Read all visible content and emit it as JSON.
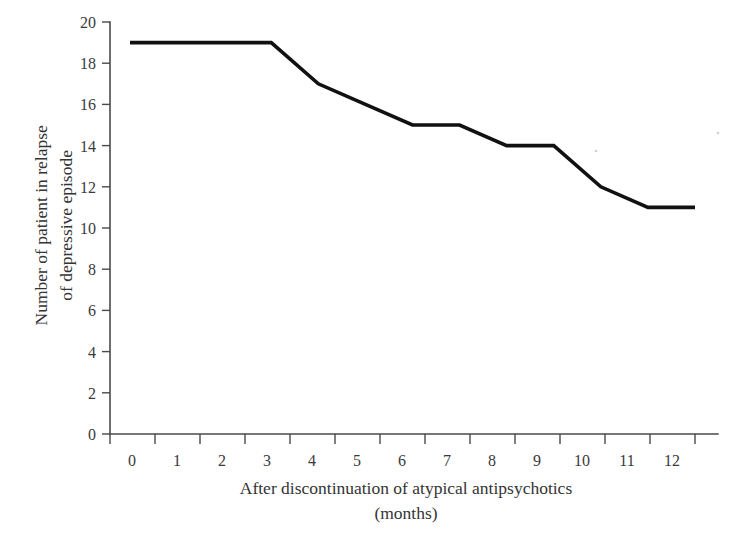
{
  "chart_data": {
    "type": "line",
    "title": "",
    "subtitle": "",
    "xlabel": "After discontinuation of atypical antipsychotics",
    "xlabel_unit": "(months)",
    "ylabel": "Number of patient in relapse\nof depressive episode",
    "ylabel_line1": "Number of patient in relapse",
    "ylabel_line2": "of depressive episode",
    "x": [
      0,
      1,
      2,
      3,
      4,
      5,
      6,
      7,
      8,
      9,
      10,
      11,
      12
    ],
    "categories": [
      "0",
      "1",
      "2",
      "3",
      "4",
      "5",
      "6",
      "7",
      "8",
      "9",
      "10",
      "11",
      "12"
    ],
    "values": [
      19,
      19,
      19,
      19,
      17,
      16,
      15,
      15,
      14,
      14,
      12,
      11,
      11
    ],
    "series": [
      {
        "name": "Patients in relapse",
        "values": [
          19,
          19,
          19,
          19,
          17,
          16,
          15,
          15,
          14,
          14,
          12,
          11,
          11
        ],
        "color": "#111111"
      }
    ],
    "xlim": [
      0,
      12
    ],
    "ylim": [
      0,
      20
    ],
    "ytick_labels": [
      "0",
      "2",
      "4",
      "6",
      "8",
      "10",
      "12",
      "14",
      "16",
      "18",
      "20"
    ],
    "ytick_values": [
      0,
      2,
      4,
      6,
      8,
      10,
      12,
      14,
      16,
      18,
      20
    ],
    "xtick_labels": [
      "0",
      "1",
      "2",
      "3",
      "4",
      "5",
      "6",
      "7",
      "8",
      "9",
      "10",
      "11",
      "12"
    ],
    "grid": false,
    "legend": false,
    "legend_position": "none",
    "line_color": "#111111",
    "axis_color": "#4a4a4a",
    "background_color": "#ffffff"
  }
}
